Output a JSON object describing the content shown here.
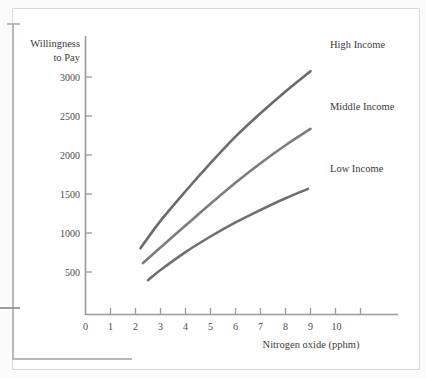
{
  "chart_data": {
    "type": "line",
    "title": "",
    "xlabel": "Nitrogen oxide (pphm)",
    "ylabel_line1": "Willingness",
    "ylabel_line2": "to Pay",
    "xlim": [
      0,
      11
    ],
    "ylim": [
      0,
      3300
    ],
    "grid": false,
    "legend_position": "right-inline",
    "xticks": [
      "0",
      "1",
      "2",
      "3",
      "4",
      "5",
      "6",
      "7",
      "8",
      "9",
      "10"
    ],
    "xtick_values": [
      0,
      1,
      2,
      3,
      4,
      5,
      6,
      7,
      8,
      9,
      10
    ],
    "yticks": [
      "500",
      "1000",
      "1500",
      "2000",
      "2500",
      "3000"
    ],
    "ytick_values": [
      500,
      1000,
      1500,
      2000,
      2500,
      3000
    ],
    "series": [
      {
        "name": "High Income",
        "color": "#6b6b6b",
        "x": [
          2.2,
          3.0,
          4.0,
          5.0,
          6.0,
          7.0,
          8.0,
          9.0
        ],
        "values": [
          850,
          1200,
          1580,
          1940,
          2280,
          2580,
          2860,
          3120
        ]
      },
      {
        "name": "Middle Income",
        "color": "#7d7d7d",
        "x": [
          2.3,
          3.0,
          4.0,
          5.0,
          6.0,
          7.0,
          8.0,
          9.0
        ],
        "values": [
          660,
          860,
          1140,
          1420,
          1690,
          1940,
          2170,
          2380
        ]
      },
      {
        "name": "Low Income",
        "color": "#6f6f6f",
        "x": [
          2.5,
          3.0,
          4.0,
          5.0,
          6.0,
          7.0,
          8.0,
          8.9
        ],
        "values": [
          440,
          570,
          800,
          1000,
          1180,
          1340,
          1490,
          1610
        ]
      }
    ],
    "annotations": [
      {
        "text": "High Income",
        "x": 10.1,
        "y": 3300
      },
      {
        "text": "Middle Income",
        "x": 10.1,
        "y": 2550
      },
      {
        "text": "Low Income",
        "x": 10.1,
        "y": 1790
      }
    ]
  },
  "axis": {
    "x_title": "Nitrogen oxide (pphm)",
    "y_title_line1": "Willingness",
    "y_title_line2": "to Pay"
  },
  "labels": {
    "high_income": "High Income",
    "middle_income": "Middle Income",
    "low_income": "Low Income"
  },
  "xticks": {
    "t0": "0",
    "t1": "1",
    "t2": "2",
    "t3": "3",
    "t4": "4",
    "t5": "5",
    "t6": "6",
    "t7": "7",
    "t8": "8",
    "t9": "9",
    "t10": "10"
  },
  "yticks": {
    "y500": "500",
    "y1000": "1000",
    "y1500": "1500",
    "y2000": "2000",
    "y2500": "2500",
    "y3000": "3000"
  }
}
